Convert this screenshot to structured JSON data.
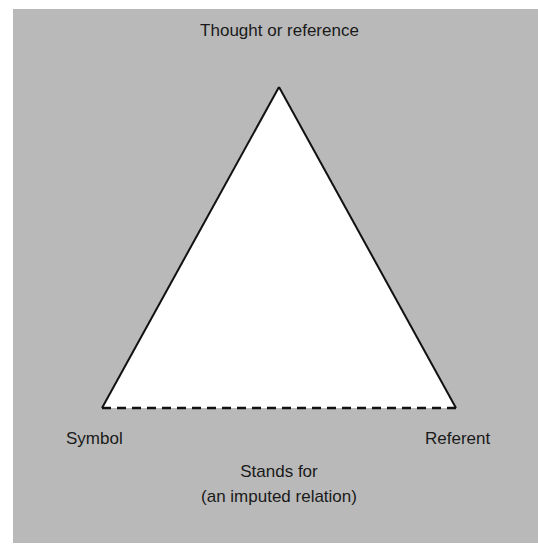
{
  "diagram": {
    "background_color": "#b9b9b9",
    "triangle_fill": "#ffffff",
    "line_color": "#111111",
    "nodes": {
      "top": "Thought or reference",
      "left": "Symbol",
      "right": "Referent"
    },
    "base_edge": {
      "style": "dashed",
      "label_line1": "Stands for",
      "label_line2": "(an imputed relation)"
    }
  }
}
